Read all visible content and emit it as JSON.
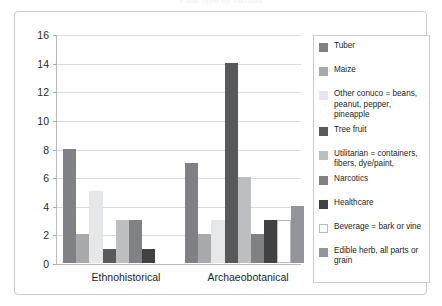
{
  "chart_data": {
    "type": "bar",
    "title": "Food type by method",
    "xlabel": "",
    "ylabel": "",
    "ylim": [
      0,
      16
    ],
    "ytick_step": 2,
    "yticks": [
      16,
      14,
      12,
      10,
      8,
      6,
      4,
      2,
      0
    ],
    "grid": true,
    "legend_position": "right",
    "categories": [
      "Ethnohistorical",
      "Archaeobotanical"
    ],
    "series": [
      {
        "name": "Tuber",
        "color": "#808184",
        "values": [
          8,
          7
        ]
      },
      {
        "name": "Maize",
        "color": "#a7a9ac",
        "values": [
          2,
          2
        ]
      },
      {
        "name": "Other conuco = beans, peanut, pepper, pineapple",
        "color": "#e6e7e8",
        "values": [
          5,
          3
        ]
      },
      {
        "name": "Tree fruit",
        "color": "#58595b",
        "values": [
          1,
          14
        ]
      },
      {
        "name": "Utilitarian = containers, fibers, dye/paint,",
        "color": "#bcbec0",
        "values": [
          3,
          6
        ]
      },
      {
        "name": "Narcotics",
        "color": "#808184",
        "values": [
          3,
          2
        ]
      },
      {
        "name": "Healthcare",
        "color": "#414042",
        "values": [
          1,
          3
        ]
      },
      {
        "name": "Beverage = bark or vine",
        "color": "#ffffff",
        "values": [
          0,
          3
        ]
      },
      {
        "name": "Edible herb, all parts or grain",
        "color": "#939598",
        "values": [
          0,
          4
        ]
      }
    ]
  },
  "legend": {
    "items": [
      {
        "label": "Tuber"
      },
      {
        "label": "Maize"
      },
      {
        "label": "Other conuco = beans, peanut, pepper, pineapple"
      },
      {
        "label": "Tree fruit"
      },
      {
        "label": "Utilitarian = containers, fibers, dye/paint,"
      },
      {
        "label": "Narcotics"
      },
      {
        "label": "Healthcare"
      },
      {
        "label": "Beverage = bark or vine"
      },
      {
        "label": "Edible herb, all parts or grain"
      }
    ]
  }
}
